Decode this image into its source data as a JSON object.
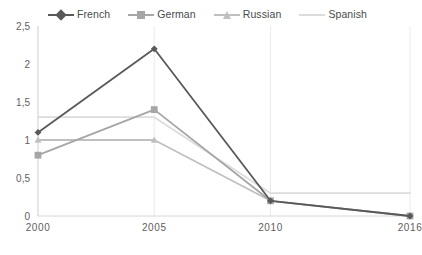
{
  "chart_data": {
    "type": "line",
    "title": "",
    "xlabel": "",
    "ylabel": "",
    "categories": [
      "2000",
      "2005",
      "2010",
      "2016"
    ],
    "x_positions": [
      0,
      5,
      10,
      16
    ],
    "ylim": [
      0,
      2.5
    ],
    "y_ticks": [
      "0",
      "0,5",
      "1",
      "1,5",
      "2",
      "2,5"
    ],
    "y_tick_values": [
      0,
      0.5,
      1,
      1.5,
      2,
      2.5
    ],
    "grid": "vertical-only",
    "legend_position": "top",
    "series": [
      {
        "name": "French",
        "color": "#595959",
        "marker": "diamond",
        "values": [
          1.1,
          2.2,
          0.2,
          0.0
        ]
      },
      {
        "name": "German",
        "color": "#a6a6a6",
        "marker": "square",
        "values": [
          0.8,
          1.4,
          0.2,
          0.0
        ]
      },
      {
        "name": "Russian",
        "color": "#c0c0c0",
        "marker": "triangle",
        "values": [
          1.0,
          1.0,
          0.2,
          null
        ]
      },
      {
        "name": "Spanish",
        "color": "#dcdcdc",
        "marker": "none",
        "values": [
          1.3,
          1.3,
          0.3,
          0.3
        ]
      }
    ]
  },
  "colors": {
    "gridline": "#ebebeb",
    "axis": "#d6d6d6",
    "tick_text": "#606060",
    "legend_text": "#4a4a4a",
    "background": "#ffffff"
  }
}
